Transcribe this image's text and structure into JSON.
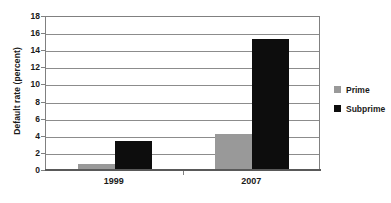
{
  "chart_data": {
    "type": "bar",
    "title": "",
    "subtitle": "",
    "xlabel": "",
    "ylabel": "Default rate (percent)",
    "categories": [
      "1999",
      "2007"
    ],
    "series": [
      {
        "name": "Prime",
        "color": "#999999",
        "values": [
          0.6,
          4.1
        ]
      },
      {
        "name": "Subprime",
        "color": "#0d0d0d",
        "values": [
          3.3,
          15.2
        ]
      }
    ],
    "ylim": [
      0,
      18
    ],
    "ytick_step": 2,
    "yticks": [
      0,
      2,
      4,
      6,
      8,
      10,
      12,
      14,
      16,
      18
    ],
    "ytick_labels": [
      "0",
      "2",
      "4",
      "6",
      "8",
      "10",
      "12",
      "14",
      "16",
      "18"
    ],
    "grid": "horizontal",
    "legend_position": "right",
    "legend_entries": [
      "Prime",
      "Subprime"
    ]
  },
  "colors": {
    "prime": "#999999",
    "subprime": "#0d0d0d",
    "gridline": "#8c8c8c",
    "axis": "#595959",
    "text": "#1a1a1a",
    "background": "#ffffff"
  }
}
